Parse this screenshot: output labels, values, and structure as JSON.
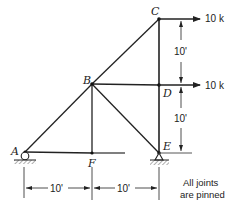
{
  "diagram": {
    "type": "truss",
    "joints": [
      {
        "id": "A",
        "label": "A"
      },
      {
        "id": "B",
        "label": "B"
      },
      {
        "id": "C",
        "label": "C"
      },
      {
        "id": "D",
        "label": "D"
      },
      {
        "id": "E",
        "label": "E"
      },
      {
        "id": "F",
        "label": "F"
      }
    ],
    "members": [
      "AB",
      "BC",
      "CD",
      "DE",
      "BD",
      "BF",
      "BE",
      "AF",
      "FE"
    ],
    "supports": [
      {
        "joint": "A",
        "type": "roller"
      },
      {
        "joint": "E",
        "type": "pin"
      }
    ],
    "loads": [
      {
        "joint": "C",
        "label": "10 k",
        "direction": "right"
      },
      {
        "joint": "D",
        "label": "10 k",
        "direction": "right"
      }
    ],
    "dimensions": {
      "vertical": [
        {
          "from": "C",
          "to": "D",
          "label": "10'"
        },
        {
          "from": "D",
          "to": "E",
          "label": "10'"
        }
      ],
      "horizontal": [
        {
          "from": "A",
          "to": "F",
          "label": "10'"
        },
        {
          "from": "F",
          "to": "E",
          "label": "10'"
        }
      ]
    },
    "note_line1": "All joints",
    "note_line2": "are pinned"
  }
}
